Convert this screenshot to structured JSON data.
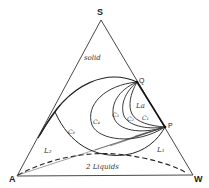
{
  "diagram": {
    "type": "ternary-phase-diagram",
    "vertices": {
      "top": {
        "label": "S",
        "x": 101,
        "y": 20
      },
      "left": {
        "label": "A",
        "x": 17,
        "y": 176
      },
      "right": {
        "label": "W",
        "x": 193,
        "y": 175
      }
    },
    "points": {
      "Q": {
        "label": "Q",
        "x": 137,
        "y": 82
      },
      "P": {
        "label": "P",
        "x": 165,
        "y": 127
      }
    },
    "regions": {
      "solid": "solid",
      "La": "La",
      "L2": "L₂",
      "L1": "L₁",
      "two_liquids": "2 Liquids"
    },
    "curves": {
      "C8": "C₈",
      "C4": "C₄",
      "C3": "C₃",
      "C2": "C₂",
      "C1": "C₁"
    },
    "colors": {
      "line": "#222222",
      "background": "#ffffff"
    }
  }
}
